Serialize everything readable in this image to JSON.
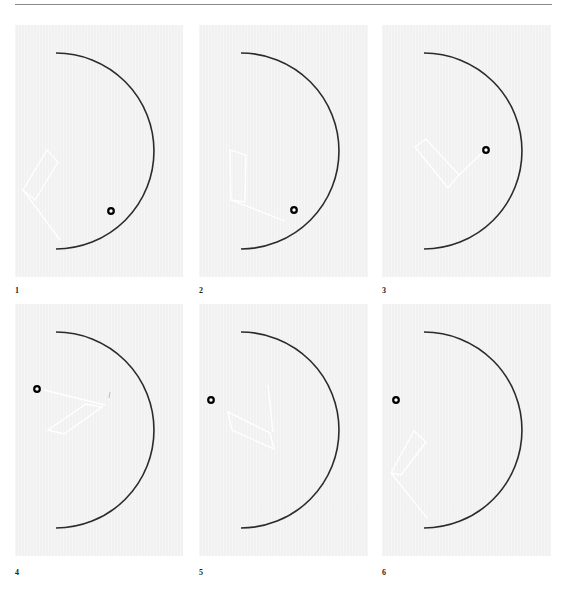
{
  "figure": {
    "colors": {
      "background": "#ffffff",
      "panel_fill": "#f1f1f1",
      "arc": "#2b2b2b",
      "figure_lines": "#ffffff",
      "marker": "#000000",
      "rule": "#8a8a8a"
    },
    "panels": [
      {
        "label": "1",
        "box": [
          15,
          25,
          168,
          252
        ],
        "arc": {
          "cx": 56,
          "cy": 151,
          "r": 98
        },
        "marker": [
          111,
          211
        ],
        "shape_poly": [
          [
            47,
            150
          ],
          [
            58,
            162
          ],
          [
            35,
            200
          ],
          [
            23,
            190
          ]
        ],
        "shape_line": [
          [
            23,
            190
          ],
          [
            60,
            240
          ]
        ]
      },
      {
        "label": "2",
        "box": [
          199,
          25,
          169,
          252
        ],
        "arc": {
          "cx": 241,
          "cy": 151,
          "r": 98
        },
        "marker": [
          294,
          210
        ],
        "shape_poly": [
          [
            230,
            150
          ],
          [
            246,
            155
          ],
          [
            245,
            202
          ],
          [
            231,
            200
          ]
        ],
        "shape_line": [
          [
            231,
            200
          ],
          [
            285,
            221
          ]
        ]
      },
      {
        "label": "3",
        "box": [
          382,
          25,
          169,
          252
        ],
        "arc": {
          "cx": 424,
          "cy": 151,
          "r": 98
        },
        "marker": [
          486,
          150
        ],
        "shape_poly": [
          [
            415,
            147
          ],
          [
            426,
            139
          ],
          [
            459,
            175
          ],
          [
            448,
            188
          ]
        ],
        "shape_line": [
          [
            459,
            175
          ],
          [
            482,
            153
          ]
        ]
      },
      {
        "label": "4",
        "box": [
          15,
          304,
          168,
          252
        ],
        "arc": {
          "cx": 56,
          "cy": 430,
          "r": 98
        },
        "marker": [
          37,
          389
        ],
        "shape_poly": [
          [
            48,
            430
          ],
          [
            64,
            434
          ],
          [
            102,
            407
          ],
          [
            86,
            404
          ]
        ],
        "shape_line": [
          [
            105,
            405
          ],
          [
            44,
            390
          ]
        ],
        "stray_mark": [
          110,
          395
        ]
      },
      {
        "label": "5",
        "box": [
          199,
          304,
          169,
          252
        ],
        "arc": {
          "cx": 241,
          "cy": 430,
          "r": 98
        },
        "marker": [
          211,
          400
        ],
        "shape_poly": [
          [
            228,
            412
          ],
          [
            232,
            430
          ],
          [
            274,
            449
          ],
          [
            270,
            433
          ]
        ],
        "shape_line": [
          [
            268,
            385
          ],
          [
            273,
            432
          ]
        ]
      },
      {
        "label": "6",
        "box": [
          382,
          304,
          169,
          252
        ],
        "arc": {
          "cx": 424,
          "cy": 430,
          "r": 98
        },
        "marker": [
          396,
          400
        ],
        "shape_poly": [
          [
            414,
            431
          ],
          [
            426,
            442
          ],
          [
            401,
            475
          ],
          [
            391,
            473
          ]
        ],
        "shape_line": [
          [
            391,
            473
          ],
          [
            427,
            518
          ]
        ]
      }
    ],
    "label_positions": [
      [
        15,
        290
      ],
      [
        199,
        290
      ],
      [
        382,
        290
      ],
      [
        15,
        572
      ],
      [
        199,
        572
      ],
      [
        382,
        572
      ]
    ]
  }
}
